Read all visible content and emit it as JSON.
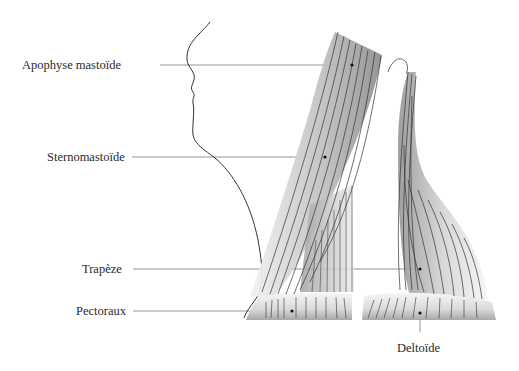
{
  "diagram": {
    "labels": [
      {
        "id": "apophyse",
        "text": "Apophyse mastoïde",
        "x": 22,
        "y": 59
      },
      {
        "id": "sterno",
        "text": "Sternomastoïde",
        "x": 47,
        "y": 150
      },
      {
        "id": "trapeze",
        "text": "Trapèze",
        "x": 82,
        "y": 262
      },
      {
        "id": "pectoraux",
        "text": "Pectoraux",
        "x": 76,
        "y": 305
      },
      {
        "id": "deltoide",
        "text": "Deltoïde",
        "x": 397,
        "y": 342
      }
    ],
    "colors": {
      "line": "#555555",
      "fiber": "#3a3a3a",
      "muscle_dark": "#8a8a8a",
      "muscle_light": "#f4f4f4",
      "text": "#2a2a2a"
    }
  }
}
